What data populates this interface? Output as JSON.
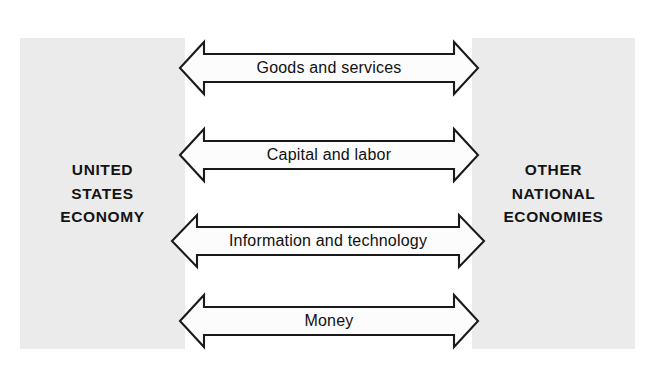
{
  "diagram": {
    "background_color": "#ffffff",
    "box_fill_color": "#ebebeb",
    "line_color": "#1a1a1a",
    "left_box": {
      "name": "united-states-economy",
      "label": "UNITED\nSTATES\nECONOMY"
    },
    "right_box": {
      "name": "other-national-economies",
      "label": "OTHER\nNATIONAL\nECONOMIES"
    },
    "flows": [
      {
        "label": "Goods and services",
        "direction": "bidirectional"
      },
      {
        "label": "Capital and labor",
        "direction": "bidirectional"
      },
      {
        "label": "Information and technology",
        "direction": "bidirectional"
      },
      {
        "label": "Money",
        "direction": "bidirectional"
      }
    ]
  }
}
